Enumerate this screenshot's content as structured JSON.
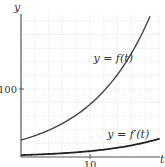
{
  "chart_data": {
    "type": "line",
    "title": "",
    "xlabel": "t",
    "ylabel": "y",
    "xlim": [
      0,
      20
    ],
    "ylim": [
      0,
      205
    ],
    "x_ticks": [
      {
        "value": 10,
        "label": "10"
      }
    ],
    "y_ticks": [
      {
        "value": 100,
        "label": "100"
      }
    ],
    "grid": true,
    "grid_x_step": 2,
    "grid_y_step": 20,
    "series": [
      {
        "name": "y = f(t)",
        "label": "y = f(t)",
        "formula": "25*exp(0.113*t)",
        "x": [
          0,
          2,
          4,
          6,
          8,
          10,
          12,
          14,
          16,
          18,
          18.7
        ],
        "values": [
          25,
          31,
          39,
          49,
          62,
          77,
          97,
          122,
          153,
          191,
          206
        ],
        "color": "#444444",
        "label_pos": {
          "t": 10.5,
          "y": 140
        }
      },
      {
        "name": "y = f'(t)",
        "label": "y = f′(t)",
        "formula": "2.8*exp(0.113*t)",
        "x": [
          0,
          2,
          4,
          6,
          8,
          10,
          12,
          14,
          16,
          18,
          20
        ],
        "values": [
          2.8,
          3.5,
          4.4,
          5.5,
          6.9,
          8.7,
          10.9,
          13.7,
          17.2,
          21.6,
          27.0
        ],
        "color": "#222222",
        "label_pos": {
          "t": 12.5,
          "y": 28
        }
      }
    ],
    "legend": "inline labels"
  }
}
